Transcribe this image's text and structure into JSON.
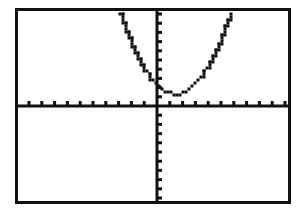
{
  "screen": {
    "device": "graphing-calculator",
    "label": "graphing calculator display",
    "background_color": "#ffffff",
    "ink_color": "#111111",
    "border_color": "#111111"
  },
  "chart_data": {
    "type": "line",
    "title": "",
    "subtitle": "",
    "xlabel": "",
    "ylabel": "",
    "xlim": [
      -10,
      10
    ],
    "ylim": [
      -10,
      10
    ],
    "grid": false,
    "legend": null,
    "axes": {
      "x_axis_visible": true,
      "y_axis_visible": true,
      "x_tick_interval": 1,
      "y_tick_interval": 1,
      "x_tick_labels": [],
      "y_tick_labels": [],
      "tick_style": "hash-marks",
      "origin_x": 0,
      "origin_y": 0
    },
    "series": [
      {
        "name": "parabola",
        "style": "dotted-pixel-plot",
        "shape": "upward-opening-parabola",
        "vertex": [
          1.5,
          1.3
        ],
        "x": [
          -3.0,
          -2.8,
          -2.6,
          -2.4,
          -2.2,
          -2.0,
          -1.8,
          -1.6,
          -1.4,
          -1.2,
          -1.0,
          -0.8,
          -0.6,
          -0.4,
          -0.2,
          0.0,
          0.2,
          0.4,
          0.6,
          0.8,
          1.0,
          1.2,
          1.4,
          1.6,
          1.8,
          2.0,
          2.2,
          2.4,
          2.6,
          2.8,
          3.0,
          3.2,
          3.4,
          3.6,
          3.8,
          4.0,
          4.2,
          4.4,
          4.6,
          4.8,
          5.0,
          5.2,
          5.4,
          5.6
        ],
        "values": [
          11.4,
          10.2,
          9.0,
          7.9,
          6.8,
          5.8,
          4.9,
          4.0,
          3.1,
          2.4,
          1.7,
          1.1,
          0.6,
          0.2,
          -0.1,
          -0.4,
          -0.6,
          -0.8,
          -0.9,
          -0.9,
          -0.9,
          -0.8,
          -0.6,
          -0.4,
          -0.1,
          0.2,
          0.6,
          1.1,
          1.7,
          2.4,
          3.1,
          4.0,
          4.9,
          5.8,
          6.8,
          7.9,
          9.0,
          10.2,
          11.5,
          12.8,
          14.2,
          15.6,
          17.1,
          18.7
        ]
      }
    ]
  }
}
